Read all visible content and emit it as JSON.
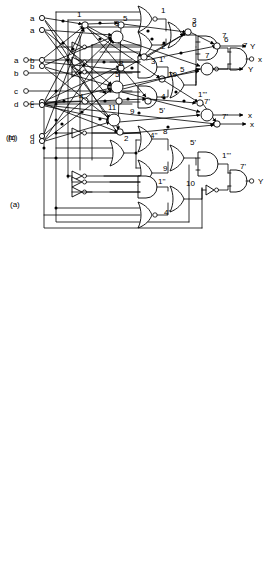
{
  "figure": {
    "panels": [
      {
        "id": "a",
        "label": "(a)",
        "caption_x": 10,
        "caption_y": 207
      },
      {
        "id": "b",
        "label": "(b)",
        "caption_x": 6,
        "caption_y": 136
      },
      {
        "id": "c",
        "label": "(c)",
        "caption_x": 8,
        "caption_y": 122
      }
    ]
  },
  "panel_a": {
    "inputs": [
      {
        "name": "a",
        "x": 14,
        "y": 60
      },
      {
        "name": "b",
        "x": 14,
        "y": 73
      },
      {
        "name": "c",
        "x": 14,
        "y": 91
      },
      {
        "name": "d",
        "x": 14,
        "y": 104
      }
    ],
    "outputs": [
      {
        "name": "x",
        "x": 256,
        "y": 59
      },
      {
        "name": "Y",
        "x": 256,
        "y": 181
      }
    ],
    "gate_labels": [
      {
        "text": "1",
        "x": 161,
        "y": 13
      },
      {
        "text": "2",
        "x": 161,
        "y": 49
      },
      {
        "text": "3",
        "x": 192,
        "y": 23
      },
      {
        "text": "1'",
        "x": 159,
        "y": 62
      },
      {
        "text": "4",
        "x": 161,
        "y": 99
      },
      {
        "text": "5",
        "x": 180,
        "y": 72
      },
      {
        "text": "6",
        "x": 224,
        "y": 42
      },
      {
        "text": "7",
        "x": 243,
        "y": 48
      },
      {
        "text": "4''",
        "x": 152,
        "y": 138
      },
      {
        "text": "8",
        "x": 163,
        "y": 134
      },
      {
        "text": "9",
        "x": 163,
        "y": 171
      },
      {
        "text": "5'",
        "x": 192,
        "y": 145
      },
      {
        "text": "1''",
        "x": 160,
        "y": 184
      },
      {
        "text": "10",
        "x": 186,
        "y": 186
      },
      {
        "text": "4'",
        "x": 164,
        "y": 215
      },
      {
        "text": "1'''",
        "x": 224,
        "y": 158
      },
      {
        "text": "7'",
        "x": 243,
        "y": 169
      }
    ],
    "gate_types": {
      "1": "nor",
      "2": "or",
      "3": "or",
      "1'": "and",
      "4": "and",
      "5": "or",
      "6": "and",
      "7": "and",
      "8": "or",
      "9": "or",
      "4''": "or",
      "5'": "or",
      "1''": "and",
      "10": "or",
      "4'": "nor",
      "1'''": "and",
      "7'": "and"
    },
    "inverter_count": 7
  },
  "panel_b": {
    "inputs": [
      {
        "name": "a",
        "x": 33,
        "y": 18
      },
      {
        "name": "b",
        "x": 33,
        "y": 60
      },
      {
        "name": "c",
        "x": 33,
        "y": 102
      },
      {
        "name": "d",
        "x": 33,
        "y": 136
      }
    ],
    "outputs": [
      {
        "name": "Y",
        "x": 250,
        "y": 46
      },
      {
        "name": "x",
        "x": 250,
        "y": 124
      }
    ],
    "node_labels": [
      {
        "text": "1",
        "x": 77,
        "y": 17
      },
      {
        "text": "5",
        "x": 121,
        "y": 21
      },
      {
        "text": "6",
        "x": 194,
        "y": 28
      },
      {
        "text": "7",
        "x": 225,
        "y": 36
      },
      {
        "text": "3",
        "x": 155,
        "y": 58
      },
      {
        "text": "8",
        "x": 118,
        "y": 67
      },
      {
        "text": "10",
        "x": 166,
        "y": 78
      },
      {
        "text": "4",
        "x": 78,
        "y": 98
      },
      {
        "text": "9",
        "x": 131,
        "y": 110
      },
      {
        "text": "5'",
        "x": 163,
        "y": 110
      },
      {
        "text": "1'''",
        "x": 202,
        "y": 101
      },
      {
        "text": "2",
        "x": 124,
        "y": 135
      },
      {
        "text": "7'",
        "x": 230,
        "y": 117
      }
    ]
  },
  "panel_c": {
    "inputs": [
      {
        "name": "a",
        "x": 33,
        "y": 30
      },
      {
        "name": "b",
        "x": 33,
        "y": 66
      },
      {
        "name": "c",
        "x": 33,
        "y": 105
      },
      {
        "name": "d",
        "x": 33,
        "y": 141
      }
    ],
    "outputs": [
      {
        "name": "Y",
        "x": 250,
        "y": 69
      },
      {
        "name": "x",
        "x": 250,
        "y": 115
      }
    ],
    "hidden_nodes": [
      {
        "text": "3",
        "x": 115,
        "y": 22
      },
      {
        "text": "5",
        "x": 115,
        "y": 89
      },
      {
        "text": "11",
        "x": 110,
        "y": 120
      }
    ],
    "output_nodes": [
      {
        "text": "7",
        "x": 206,
        "y": 56
      },
      {
        "text": "7'",
        "x": 208,
        "y": 102
      }
    ]
  },
  "colors": {
    "stroke": "#000000",
    "fill": "#ffffff",
    "background": "#ffffff"
  }
}
